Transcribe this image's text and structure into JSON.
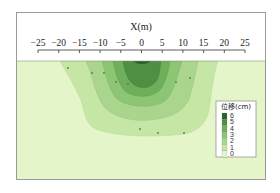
{
  "chart_data": {
    "type": "heatmap",
    "subtype": "filled-contour",
    "title": "",
    "xlabel": "X(m)",
    "ylabel": "",
    "x_ticks": [
      -25,
      -20,
      -15,
      -10,
      -5,
      0,
      5,
      10,
      15,
      20,
      25
    ],
    "x_tick_labels": [
      "−25",
      "−20",
      "−15",
      "−10",
      "−5",
      "0",
      "5",
      "10",
      "15",
      "20",
      "25"
    ],
    "xlim": [
      -25,
      25
    ],
    "xaxis_position": "top",
    "grid": false,
    "legend": {
      "title": "位移(cm)",
      "position": "right-bottom",
      "levels": [
        6,
        5,
        4,
        3,
        2,
        1,
        0
      ],
      "level_labels": [
        "6",
        "5",
        "4",
        "3",
        "2",
        "1",
        "0"
      ]
    },
    "contour_levels": [
      {
        "min": 0,
        "max": 1,
        "color": "#e4f6c9",
        "x_extent_top": [
          -25,
          25
        ]
      },
      {
        "min": 1,
        "max": 2,
        "color": "#c6e6a6",
        "x_extent_top": [
          -18.5,
          18
        ]
      },
      {
        "min": 2,
        "max": 3,
        "color": "#a9d68c",
        "x_extent_top": [
          -12,
          12
        ]
      },
      {
        "min": 3,
        "max": 4,
        "color": "#8cc574",
        "x_extent_top": [
          -8.5,
          9
        ]
      },
      {
        "min": 4,
        "max": 5,
        "color": "#6fae5b",
        "x_extent_top": [
          -5.5,
          6
        ]
      },
      {
        "min": 5,
        "max": 6,
        "color": "#4f8f44",
        "x_extent_top": [
          -3.5,
          4
        ]
      },
      {
        "min": 6,
        "max": 7,
        "color": "#2f5f2c",
        "x_extent_top": [
          -1.5,
          1.5
        ]
      }
    ]
  },
  "colors": {
    "frame": "#9a9a9a",
    "background": "#e4f6c9",
    "level_1": "#c6e6a6",
    "level_2": "#a9d68c",
    "level_3": "#8cc574",
    "level_4": "#6fae5b",
    "level_5": "#4f8f44",
    "level_6": "#2f5f2c"
  }
}
